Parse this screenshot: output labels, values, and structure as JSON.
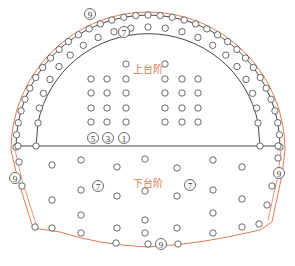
{
  "diagram": {
    "title": "",
    "colors": {
      "contour": "#e07b52",
      "line": "#333333",
      "hole_stroke": "#444444",
      "label": "#e07b52"
    },
    "labels": {
      "upper_bench": "上台阶",
      "lower_bench": "下台阶"
    },
    "upper_bench": {
      "label_pos": [
        133,
        69
      ],
      "perimeter_holes_numbered": [
        {
          "x": 90,
          "y": 14,
          "n": "9"
        }
      ],
      "inner_arc_numbered": [
        {
          "x": 124,
          "y": 32,
          "n": "7"
        }
      ],
      "bottom_row_numbered": [
        {
          "x": 93,
          "y": 138,
          "n": "5"
        },
        {
          "x": 108,
          "y": 138,
          "n": "3"
        },
        {
          "x": 124,
          "y": 138,
          "n": "1"
        }
      ],
      "core_holes": [
        [
          126,
          64
        ],
        [
          165,
          64
        ],
        [
          91,
          79
        ],
        [
          107,
          79
        ],
        [
          126,
          79
        ],
        [
          165,
          79
        ],
        [
          182,
          79
        ],
        [
          198,
          79
        ],
        [
          91,
          93
        ],
        [
          107,
          93
        ],
        [
          126,
          93
        ],
        [
          165,
          93
        ],
        [
          182,
          93
        ],
        [
          198,
          93
        ],
        [
          91,
          108
        ],
        [
          107,
          108
        ],
        [
          126,
          108
        ],
        [
          165,
          108
        ],
        [
          182,
          108
        ],
        [
          198,
          108
        ],
        [
          91,
          122
        ],
        [
          107,
          122
        ],
        [
          126,
          122
        ],
        [
          165,
          122
        ],
        [
          182,
          122
        ],
        [
          198,
          122
        ]
      ]
    },
    "lower_bench": {
      "label_pos": [
        133,
        183
      ],
      "numbered": [
        {
          "x": 98,
          "y": 186,
          "n": "7"
        },
        {
          "x": 190,
          "y": 185,
          "n": "7"
        },
        {
          "x": 15,
          "y": 178,
          "n": "9"
        },
        {
          "x": 279,
          "y": 173,
          "n": "9"
        },
        {
          "x": 161,
          "y": 244,
          "n": "9"
        }
      ],
      "holes": [
        [
          52,
          165
        ],
        [
          81,
          160
        ],
        [
          117,
          167
        ],
        [
          145,
          159
        ],
        [
          177,
          168
        ],
        [
          213,
          160
        ],
        [
          242,
          167
        ],
        [
          52,
          200
        ],
        [
          81,
          190
        ],
        [
          117,
          196
        ],
        [
          145,
          191
        ],
        [
          177,
          196
        ],
        [
          213,
          190
        ],
        [
          242,
          199
        ],
        [
          81,
          215
        ],
        [
          145,
          220
        ],
        [
          213,
          213
        ],
        [
          35,
          227
        ],
        [
          52,
          228
        ],
        [
          81,
          233
        ],
        [
          117,
          228
        ],
        [
          145,
          233
        ],
        [
          177,
          228
        ],
        [
          213,
          233
        ],
        [
          242,
          227
        ],
        [
          259,
          224
        ]
      ],
      "contour_holes": [
        [
          19,
          162
        ],
        [
          22,
          186
        ],
        [
          116,
          243
        ],
        [
          148,
          244
        ],
        [
          178,
          244
        ],
        [
          272,
          186
        ],
        [
          267,
          205
        ],
        [
          278,
          158
        ]
      ]
    }
  }
}
